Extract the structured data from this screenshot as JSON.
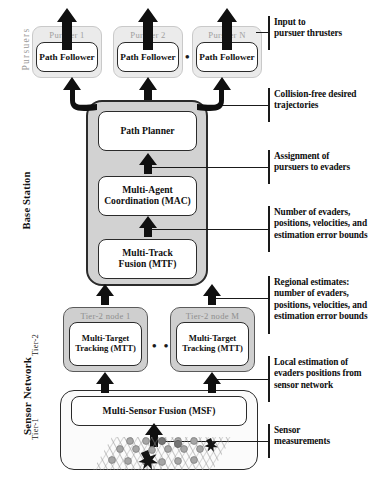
{
  "figure": {
    "type": "hierarchical-system-architecture-diagram"
  },
  "side_labels": {
    "pursuers": "Pursuers",
    "base_station": "Base Station",
    "sensor_network": "Sensor Network",
    "tier2": "Tier-2",
    "tier1": "Tier-1"
  },
  "pursuers": {
    "ellipsis": "• • •",
    "items": [
      {
        "title": "Pursuer 1",
        "module": "Path Follower"
      },
      {
        "title": "Pursuer 2",
        "module": "Path Follower"
      },
      {
        "title": "Pursuer N",
        "module": "Path Follower"
      }
    ]
  },
  "base_station": {
    "modules": [
      {
        "line1": "Path Planner",
        "line2": ""
      },
      {
        "line1": "Multi-Agent",
        "line2": "Coordination (MAC)"
      },
      {
        "line1": "Multi-Track",
        "line2": "Fusion (MTF)"
      }
    ]
  },
  "tier2": {
    "ellipsis": "• • •",
    "nodes": [
      {
        "title": "Tier-2 node 1",
        "line1": "Multi-Target",
        "line2": "Tracking (MTT)"
      },
      {
        "title": "Tier-2 node M",
        "line1": "Multi-Target",
        "line2": "Tracking (MTT)"
      }
    ]
  },
  "tier1": {
    "module": "Multi-Sensor Fusion (MSF)",
    "field_caption": ""
  },
  "annotations": [
    {
      "id": "input-to-pursuer-thrusters",
      "line1": "Input to",
      "line2": "pursuer thrusters",
      "line3": "",
      "line4": ""
    },
    {
      "id": "collision-free-trajectories",
      "line1": "Collision-free desired",
      "line2": "trajectories",
      "line3": "",
      "line4": ""
    },
    {
      "id": "assignment-of-pursuers",
      "line1": "Assignment of",
      "line2": "pursuers to evaders",
      "line3": "",
      "line4": ""
    },
    {
      "id": "evader-estimates",
      "line1": "Number of evaders,",
      "line2": "positions, velocities, and",
      "line3": "estimation error bounds",
      "line4": ""
    },
    {
      "id": "regional-estimates",
      "line1": "Regional estimates:",
      "line2": "number of evaders,",
      "line3": "positions, velocities, and",
      "line4": "estimation error bounds"
    },
    {
      "id": "local-estimation",
      "line1": "Local estimation of",
      "line2": "evaders positions from",
      "line3": "sensor network",
      "line4": ""
    },
    {
      "id": "sensor-measurements",
      "line1": "Sensor",
      "line2": "measurements",
      "line3": "",
      "line4": ""
    }
  ],
  "colors": {
    "group_fill": "#d2d2d2",
    "node_fill": "#cfcfcf",
    "box_fill": "#ffffff",
    "stroke": "#2b2b2b",
    "muted_title": "#a0a0a0",
    "arrow": "#101010",
    "sensor_node": "#a8a8a8",
    "evader": "#1a1a1a"
  }
}
